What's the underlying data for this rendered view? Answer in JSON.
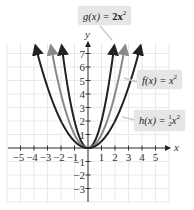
{
  "chart_data": {
    "type": "line",
    "title": "",
    "xlabel": "x",
    "ylabel": "y",
    "xlim": [
      -6,
      6
    ],
    "ylim": [
      -4,
      8
    ],
    "grid": true,
    "x_ticks": [
      -5,
      -4,
      -3,
      -2,
      -1,
      1,
      2,
      3,
      4,
      5
    ],
    "y_ticks": [
      -3,
      -2,
      -1,
      1,
      2,
      3,
      4,
      5,
      6,
      7
    ],
    "series": [
      {
        "name": "g(x) = 2x²",
        "formula": "2x^2",
        "color": "#222222",
        "x": [
          -2,
          -1.5,
          -1,
          -0.5,
          0,
          0.5,
          1,
          1.5,
          2
        ],
        "values": [
          8,
          4.5,
          2,
          0.5,
          0,
          0.5,
          2,
          4.5,
          8
        ]
      },
      {
        "name": "f(x) = x²",
        "formula": "x^2",
        "color": "#888888",
        "x": [
          -2.8,
          -2,
          -1,
          0,
          1,
          2,
          2.8
        ],
        "values": [
          7.84,
          4,
          1,
          0,
          1,
          4,
          7.84
        ]
      },
      {
        "name": "h(x) = ½x²",
        "formula": "0.5x^2",
        "color": "#222222",
        "x": [
          -4,
          -3,
          -2,
          -1,
          0,
          1,
          2,
          3,
          4
        ],
        "values": [
          8,
          4.5,
          2,
          0.5,
          0,
          0.5,
          2,
          4.5,
          8
        ]
      }
    ],
    "annotations": [
      "g(x) = 2x²",
      "f(x) = x²",
      "h(x) = ½x²"
    ]
  },
  "labels": {
    "g_name": "g(x) = ",
    "g_expr": "2x",
    "g_exp": "2",
    "f_name": "f(x) = ",
    "f_expr": "x",
    "f_exp": "2",
    "h_name": "h(x) = ",
    "h_num": "1",
    "h_den": "2",
    "h_expr": "x",
    "h_exp": "2"
  },
  "axes": {
    "x_label": "x",
    "y_label": "y",
    "x_tick_labels": [
      "−5",
      "−4",
      "−3",
      "−2",
      "−1",
      "1",
      "2",
      "3",
      "4",
      "5"
    ],
    "y_tick_labels": [
      "7",
      "6",
      "5",
      "4",
      "3",
      "2",
      "1",
      "−1",
      "−2",
      "−3"
    ]
  }
}
